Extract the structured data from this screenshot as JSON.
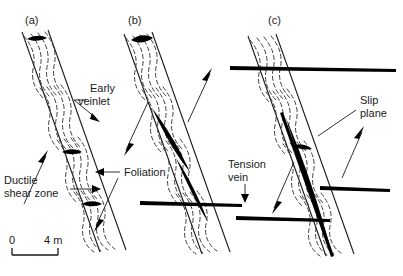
{
  "figure": {
    "background": "#ffffff",
    "ink": "#1a1a1a",
    "foliation_color": "#3d3d3d",
    "vein_color": "#000000"
  },
  "panels": [
    {
      "id": "a",
      "label": "(a)",
      "x": 25,
      "y": 20
    },
    {
      "id": "b",
      "label": "(b)",
      "x": 128,
      "y": 20
    },
    {
      "id": "c",
      "label": "(c)",
      "x": 268,
      "y": 20
    }
  ],
  "annotations": {
    "early_veinlet": {
      "line1": "Early",
      "line2": "veinlet",
      "x": 90,
      "y": 92
    },
    "ductile_shear_zone": {
      "line1": "Ductile",
      "line2": "shear zone",
      "x": 4,
      "y": 184
    },
    "foliation": {
      "label": "Foliation",
      "x": 124,
      "y": 176
    },
    "tension_vein": {
      "line1": "Tension",
      "line2": "vein",
      "x": 228,
      "y": 168
    },
    "slip_plane": {
      "line1": "Slip",
      "line2": "plane",
      "x": 360,
      "y": 104
    }
  },
  "scale": {
    "zero_label": "0",
    "max_label": "4 m",
    "x_start": 12,
    "x_end": 58,
    "y": 248,
    "tick_height": 7
  }
}
